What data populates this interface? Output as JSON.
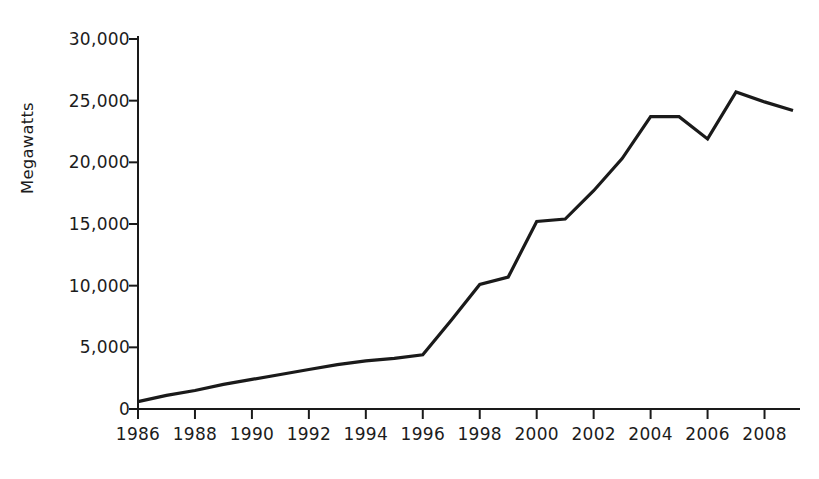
{
  "chart_data": {
    "type": "line",
    "title": "",
    "subtitle": "",
    "xlabel": "",
    "ylabel": "Megawatts",
    "xlim": [
      1986,
      2009
    ],
    "ylim": [
      0,
      30000
    ],
    "grid": false,
    "legend": null,
    "line_color": "#1a1a1a",
    "background_color": "#ffffff",
    "y_ticks": [
      0,
      5000,
      10000,
      15000,
      20000,
      25000,
      30000
    ],
    "y_tick_labels": [
      "0",
      "5,000",
      "10,000",
      "15,000",
      "20,000",
      "25,000",
      "30,000"
    ],
    "x_ticks": [
      1986,
      1988,
      1990,
      1992,
      1994,
      1996,
      1998,
      2000,
      2002,
      2004,
      2006,
      2008
    ],
    "x_tick_labels": [
      "1986",
      "1988",
      "1990",
      "1992",
      "1994",
      "1996",
      "1998",
      "2000",
      "2002",
      "2004",
      "2006",
      "2008"
    ],
    "x": [
      1986,
      1987,
      1988,
      1989,
      1990,
      1991,
      1992,
      1993,
      1994,
      1995,
      1996,
      1997,
      1998,
      1999,
      2000,
      2001,
      2002,
      2003,
      2004,
      2005,
      2006,
      2007,
      2008,
      2009
    ],
    "values": [
      600,
      1100,
      1500,
      2000,
      2400,
      2800,
      3200,
      3600,
      3900,
      4100,
      4400,
      7200,
      10100,
      10700,
      15200,
      15400,
      17700,
      20300,
      23700,
      23700,
      21900,
      25700,
      24900,
      24200
    ],
    "series": [
      {
        "name": "Megawatts",
        "values": [
          600,
          1100,
          1500,
          2000,
          2400,
          2800,
          3200,
          3600,
          3900,
          4100,
          4400,
          7200,
          10100,
          10700,
          15200,
          15400,
          17700,
          20300,
          23700,
          23700,
          21900,
          25700,
          24900,
          24200
        ]
      }
    ]
  }
}
